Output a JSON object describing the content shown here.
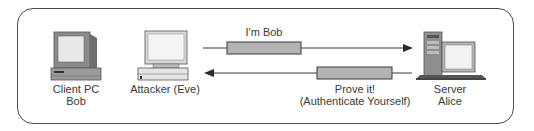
{
  "diagram": {
    "nodes": [
      {
        "id": "client",
        "icon": "desktop-pc-icon",
        "label_line1": "Client PC",
        "label_line2": "Bob"
      },
      {
        "id": "attacker",
        "icon": "desktop-pc-icon",
        "label_line1": "Attacker (Eve)"
      },
      {
        "id": "server",
        "icon": "server-tower-icon",
        "label_line1": "Server",
        "label_line2": "Alice"
      }
    ],
    "messages": [
      {
        "from": "attacker",
        "to": "server",
        "label_line1": "I'm Bob"
      },
      {
        "from": "server",
        "to": "attacker",
        "label_line1": "Prove it!",
        "label_line2": "(Authenticate Yourself)"
      }
    ],
    "colors": {
      "border": "#4a4a4a",
      "packet_fill": "#b3b3b3",
      "line": "#3a3a3a"
    }
  }
}
